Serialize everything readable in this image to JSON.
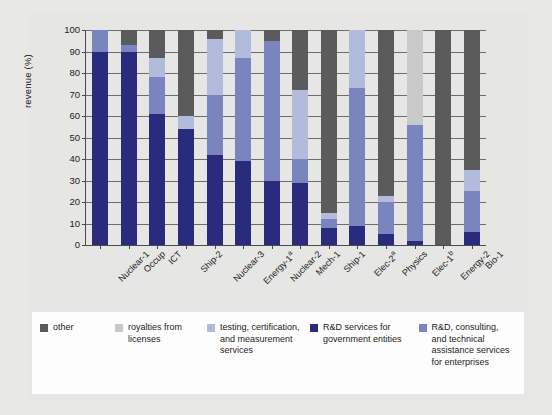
{
  "chart_data": {
    "type": "bar",
    "title": "",
    "subtitle": "",
    "xlabel": "",
    "ylabel": "revenue (%)",
    "ylim": [
      0,
      100
    ],
    "yticks": [
      0,
      10,
      20,
      30,
      40,
      50,
      60,
      70,
      80,
      90,
      100
    ],
    "grid": true,
    "stacked": true,
    "legend_position": "bottom",
    "categories": [
      "Nuclear-1",
      "Occup",
      "ICT",
      "Ship-2",
      "Nuclear-3",
      "Energy-1ᵃ",
      "Nuclear-2",
      "Mech-1",
      "Ship-1",
      "Elec-2ᵃ",
      "Physics",
      "Elec-1ᵇ",
      "Energy-2",
      "Bio-1"
    ],
    "series": [
      {
        "name": "R&D services for government entities",
        "color": "#2b2b7e",
        "values": [
          90,
          90,
          61,
          54,
          42,
          39,
          30,
          29,
          8,
          9,
          5,
          2,
          0,
          6
        ]
      },
      {
        "name": "R&D, consulting, and technical assistance services for enterprises",
        "color": "#7a84bf",
        "values": [
          10,
          3,
          17,
          0,
          28,
          48,
          65,
          11,
          4,
          64,
          15,
          54,
          0,
          19
        ]
      },
      {
        "name": "testing, certification, and measurement services",
        "color": "#b3bbdd",
        "values": [
          0,
          0,
          9,
          6,
          26,
          13,
          0,
          32,
          3,
          27,
          3,
          0,
          0,
          10
        ]
      },
      {
        "name": "royalties from licenses",
        "color": "#c9c9c9",
        "values": [
          0,
          0,
          0,
          0,
          0,
          0,
          0,
          0,
          0,
          0,
          0,
          44,
          0,
          0
        ]
      },
      {
        "name": "other",
        "color": "#5b5b5b",
        "values": [
          0,
          7,
          13,
          40,
          4,
          0,
          5,
          28,
          85,
          0,
          77,
          0,
          100,
          65
        ]
      }
    ]
  },
  "legend": {
    "items": [
      {
        "label": "other",
        "color": "#5b5b5b"
      },
      {
        "label": "royalties from licenses",
        "color": "#c9c9c9"
      },
      {
        "label": "testing, certification, and measurement services",
        "color": "#b3bbdd"
      },
      {
        "label": "R&D services for government entities",
        "color": "#2b2b7e"
      },
      {
        "label": "R&D, consulting, and technical assistance services for enterprises",
        "color": "#7a84bf"
      }
    ]
  },
  "caption": "RDIs for which the states are, on average, 50 percent or more of revenue"
}
